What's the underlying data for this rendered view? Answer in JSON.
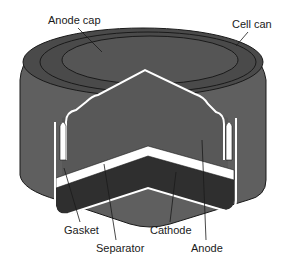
{
  "diagram": {
    "labels": {
      "anode_cap": "Anode cap",
      "cell_can": "Cell can",
      "gasket": "Gasket",
      "separator": "Separator",
      "cathode": "Cathode",
      "anode": "Anode"
    },
    "colors": {
      "can_outer": "#5f5f5f",
      "can_top": "#4a4a4a",
      "anode": "#585858",
      "cathode": "#2f2f2f",
      "separator": "#ffffff",
      "outline": "#1a1a1a"
    }
  }
}
